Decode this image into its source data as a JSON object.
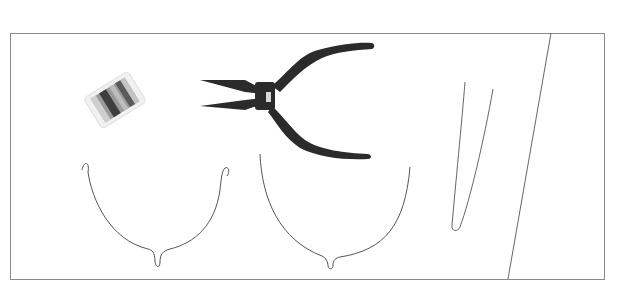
{
  "image": {
    "description": "Illustration of wire-craft tools and shaped wire pieces inside a rectangular frame",
    "background_color": "#ffffff",
    "frame_color": "#8a8a8a",
    "objects": [
      {
        "name": "wire-spool",
        "color": "#6e6e6e"
      },
      {
        "name": "pliers",
        "color": "#2a2a2a"
      },
      {
        "name": "wire-shape-u-left",
        "color": "#555555"
      },
      {
        "name": "wire-shape-u-right",
        "color": "#555555"
      },
      {
        "name": "wire-hairpin",
        "color": "#555555"
      },
      {
        "name": "diagonal-line",
        "color": "#555555"
      }
    ]
  }
}
